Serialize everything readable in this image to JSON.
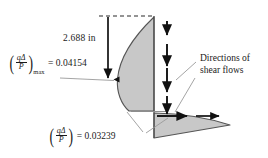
{
  "figure": {
    "name": "shear-flow-distribution-diagram",
    "background_color": "#ffffff",
    "shape_fill_color": "#c8c8c8",
    "shape_stroke_color": "#4d4d4d",
    "ink_color": "#1a1a1a",
    "leader_line_color": "#9a9a9a"
  },
  "dimension": {
    "label": "2.688 in"
  },
  "max_shear": {
    "paren_open": "(",
    "paren_close": ")",
    "numerator": "qΔ",
    "denominator": "P",
    "subscript": "max",
    "equals_value": "= 0.04154",
    "value": 0.04154
  },
  "flange_shear": {
    "paren_open": "(",
    "paren_close": ")",
    "numerator": "qΔ",
    "denominator": "P",
    "subscript": "",
    "equals_value": "= 0.03239",
    "value": 0.03239
  },
  "directions_note": {
    "text": "Directions of shear flows"
  },
  "arrows": {
    "dimension_arrow": "down-arrow-long",
    "web_arrow_1": "down-arrow",
    "web_arrow_2": "down-arrow",
    "web_arrow_3": "down-arrow",
    "web_arrow_4": "down-arrow",
    "flange_arrow_1": "right-arrow",
    "flange_arrow_2": "right-arrow"
  }
}
